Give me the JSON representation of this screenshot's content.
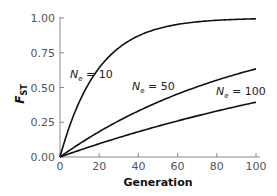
{
  "chart_data": {
    "type": "line",
    "title": "",
    "xlabel": "Generation",
    "ylabel": "F_ST",
    "ylabel_main": "F",
    "ylabel_sub": "ST",
    "xlim": [
      0,
      100
    ],
    "ylim": [
      0,
      1
    ],
    "xticks": [
      "0",
      "20",
      "40",
      "60",
      "80",
      "100"
    ],
    "yticks": [
      "0.00",
      "0.25",
      "0.50",
      "0.75",
      "1.00"
    ],
    "grid": false,
    "legend": "inline annotations",
    "series": [
      {
        "name": "Ne = 10",
        "label_main": "N",
        "label_sub": "e",
        "label_rest": " = 10",
        "Ne": 10,
        "x": [
          0,
          10,
          20,
          30,
          40,
          50,
          60,
          70,
          80,
          90,
          100
        ],
        "values": [
          0.0,
          0.4,
          0.64,
          0.79,
          0.87,
          0.92,
          0.95,
          0.97,
          0.98,
          0.99,
          0.99
        ]
      },
      {
        "name": "Ne = 50",
        "label_main": "N",
        "label_sub": "e",
        "label_rest": " = 50",
        "Ne": 50,
        "x": [
          0,
          10,
          20,
          30,
          40,
          50,
          60,
          70,
          80,
          90,
          100
        ],
        "values": [
          0.0,
          0.1,
          0.18,
          0.26,
          0.33,
          0.39,
          0.45,
          0.51,
          0.55,
          0.6,
          0.63
        ]
      },
      {
        "name": "Ne = 100",
        "label_main": "N",
        "label_sub": "e",
        "label_rest": " = 100",
        "Ne": 100,
        "x": [
          0,
          10,
          20,
          30,
          40,
          50,
          60,
          70,
          80,
          90,
          100
        ],
        "values": [
          0.0,
          0.05,
          0.1,
          0.14,
          0.18,
          0.22,
          0.26,
          0.3,
          0.33,
          0.36,
          0.39
        ]
      }
    ]
  }
}
